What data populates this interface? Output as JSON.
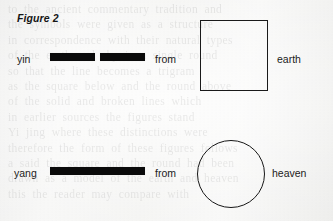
{
  "figure": {
    "caption": "Figure 2",
    "rows": [
      {
        "name": "yin-row",
        "label": "yin",
        "line_type": "broken",
        "connector": "from",
        "shape": "square",
        "shape_label": "earth"
      },
      {
        "name": "yang-row",
        "label": "yang",
        "line_type": "solid",
        "connector": "from",
        "shape": "circle",
        "shape_label": "heaven"
      }
    ],
    "colors": {
      "ink": "#1a1a1a",
      "bar_fill": "#0a0a0a",
      "paper": "#f2f2f0"
    }
  },
  "background_bleed_through": {
    "lines": [
      "to the ancient commentary tradition and",
      "the symbols were given as a structure",
      "in correspondence with their natural types",
      "of the earth and sky in a single round",
      "so that the line becomes a trigram",
      "as the square below and the round above",
      "of the solid and broken lines which",
      "in earlier sources the figures stand",
      "Yi jing where these distinctions were",
      "therefore the form of these figures follows",
      "a said the square and the round had been",
      "drawn as a model of the earth and heaven",
      "this the reader may compare with"
    ]
  }
}
